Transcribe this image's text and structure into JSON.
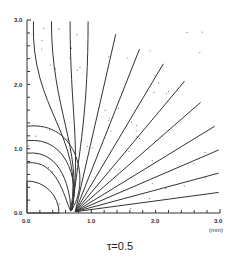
{
  "chart_data": {
    "type": "line",
    "title": "",
    "caption": "τ=0.5",
    "xlabel": "(mm)",
    "ylabel": "",
    "xlim": [
      0,
      3.0
    ],
    "ylim": [
      0,
      3.0
    ],
    "x_ticks": [
      "0.0",
      "1.0",
      "2.0",
      "3.0"
    ],
    "y_ticks": [
      "0.0",
      "1.0",
      "2.0",
      "3.0"
    ],
    "grid": false,
    "legend": null,
    "obstacle": {
      "shape": "quarter-circle",
      "center": [
        0,
        0
      ],
      "radius": 0.5
    }
  },
  "axes": {
    "x_tick_labels": [
      "0.0",
      "1.0",
      "2.0",
      "3.0"
    ],
    "y_tick_labels": [
      "0.0",
      "1.0",
      "2.0",
      "3.0"
    ],
    "x_unit": "(mm)"
  },
  "caption": "τ=0.5"
}
